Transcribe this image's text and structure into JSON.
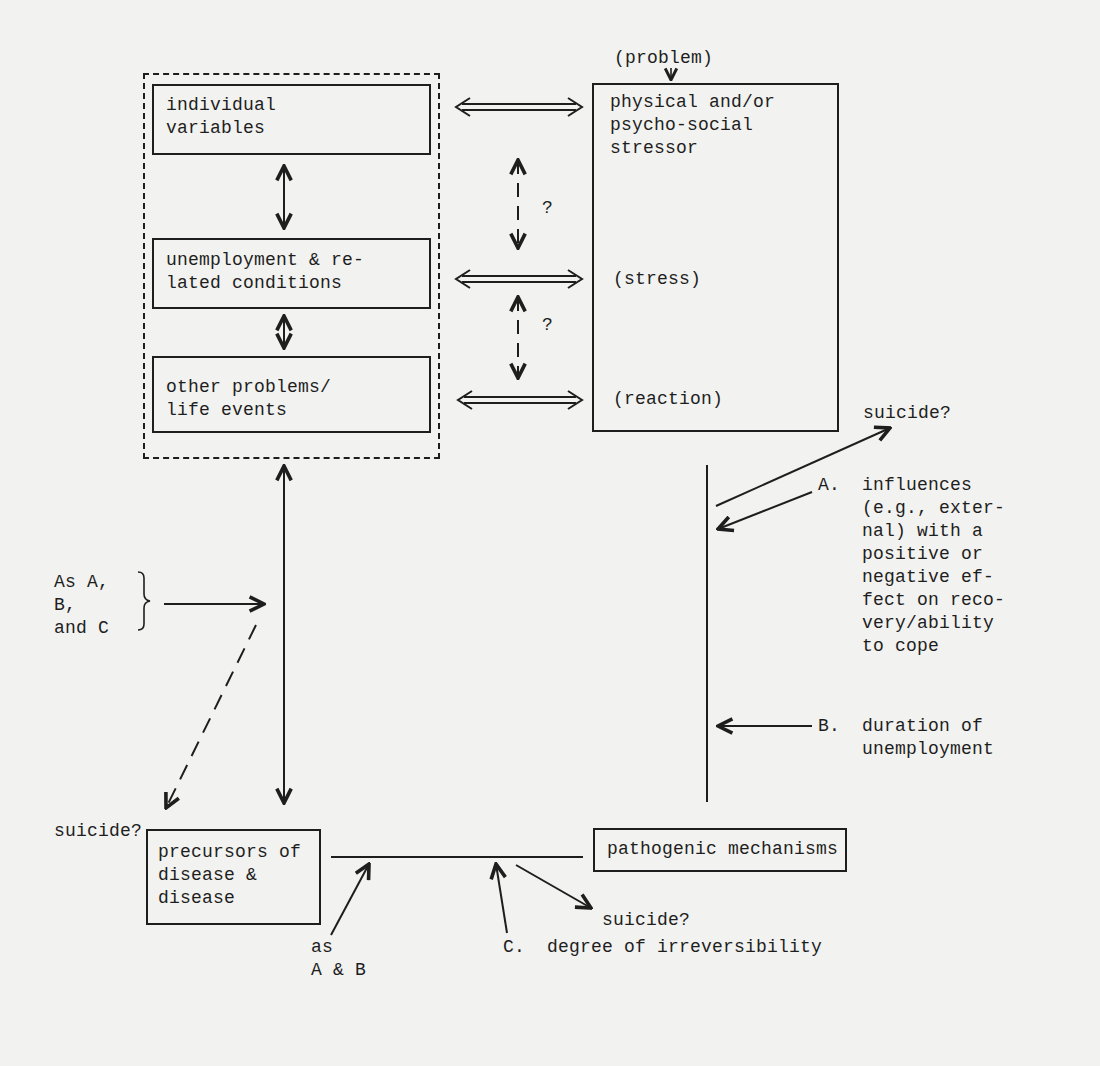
{
  "diagram": {
    "title": "",
    "left_group": {
      "boxes": [
        {
          "id": "individual",
          "lines": [
            "individual",
            "variables"
          ]
        },
        {
          "id": "unemployment",
          "lines": [
            "unemployment & re-",
            "lated conditions"
          ]
        },
        {
          "id": "other",
          "lines": [
            "other problems/",
            "life events"
          ]
        }
      ]
    },
    "right_box": {
      "top_label": "(problem)",
      "lines": [
        "physical and/or",
        "psycho-social",
        "stressor"
      ],
      "stress_label": "(stress)",
      "reaction_label": "(reaction)"
    },
    "question_marks": [
      "?",
      "?"
    ],
    "suicide_labels": {
      "top_right": "suicide?",
      "left": "suicide?",
      "bottom_middle": "suicide?"
    },
    "influence_a": {
      "label": "A.",
      "lines": [
        "influences",
        "(e.g., exter-",
        "nal) with a",
        "positive or",
        "negative ef-",
        "fect on reco-",
        "very/ability",
        "to cope"
      ]
    },
    "influence_b": {
      "label": "B.",
      "lines": [
        "duration of",
        "unemployment"
      ]
    },
    "influence_c": {
      "label": "C.",
      "text": "degree of irreversibility"
    },
    "as_abc": {
      "lines": [
        "As A,",
        "B,",
        "and C"
      ]
    },
    "as_ab": {
      "lines": [
        "as",
        "A & B"
      ]
    },
    "bottom_boxes": {
      "precursors": {
        "lines": [
          "precursors of",
          "disease &",
          "disease"
        ]
      },
      "pathogenic": {
        "lines": [
          "pathogenic mechanisms"
        ]
      }
    },
    "colors": {
      "ink": "#1e1e1e",
      "paper": "#f2f2f0"
    }
  }
}
